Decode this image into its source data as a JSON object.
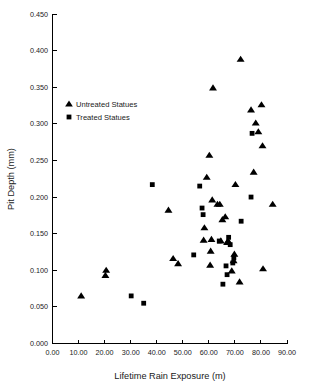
{
  "chart_data": {
    "type": "scatter",
    "title": "",
    "xlabel": "Lifetime Rain Exposure (m)",
    "ylabel": "Pit Depth (mm)",
    "xlim": [
      0,
      90
    ],
    "ylim": [
      0,
      0.45
    ],
    "xticks": [
      "0.00",
      "10.00",
      "20.00",
      "30.00",
      "40.00",
      "50.00",
      "60.00",
      "70.00",
      "80.00",
      "90.00"
    ],
    "xtick_values": [
      0,
      10,
      20,
      30,
      40,
      50,
      60,
      70,
      80,
      90
    ],
    "yticks": [
      "0.000",
      "0.050",
      "0.100",
      "0.150",
      "0.200",
      "0.250",
      "0.300",
      "0.350",
      "0.400",
      "0.450"
    ],
    "ytick_values": [
      0,
      0.05,
      0.1,
      0.15,
      0.2,
      0.25,
      0.3,
      0.35,
      0.4,
      0.45
    ],
    "grid": false,
    "legend_position": "upper-left-inside",
    "series": [
      {
        "name": "Untreated Statues",
        "marker": "triangle",
        "color": "#000000",
        "points": [
          [
            11.0,
            0.065
          ],
          [
            20.3,
            0.093
          ],
          [
            20.6,
            0.1
          ],
          [
            44.5,
            0.182
          ],
          [
            46.3,
            0.116
          ],
          [
            48.2,
            0.109
          ],
          [
            58.0,
            0.141
          ],
          [
            58.3,
            0.158
          ],
          [
            59.2,
            0.227
          ],
          [
            60.2,
            0.257
          ],
          [
            60.5,
            0.107
          ],
          [
            60.7,
            0.126
          ],
          [
            61.0,
            0.142
          ],
          [
            61.3,
            0.196
          ],
          [
            61.6,
            0.349
          ],
          [
            63.3,
            0.19
          ],
          [
            64.2,
            0.19
          ],
          [
            64.6,
            0.14
          ],
          [
            65.2,
            0.169
          ],
          [
            66.3,
            0.173
          ],
          [
            67.0,
            0.138
          ],
          [
            67.4,
            0.14
          ],
          [
            68.8,
            0.099
          ],
          [
            69.5,
            0.113
          ],
          [
            69.8,
            0.122
          ],
          [
            70.2,
            0.217
          ],
          [
            71.8,
            0.084
          ],
          [
            72.2,
            0.388
          ],
          [
            76.2,
            0.319
          ],
          [
            77.2,
            0.234
          ],
          [
            78.0,
            0.301
          ],
          [
            79.0,
            0.289
          ],
          [
            80.2,
            0.326
          ],
          [
            80.6,
            0.27
          ],
          [
            80.8,
            0.102
          ],
          [
            84.5,
            0.19
          ]
        ]
      },
      {
        "name": "Treated Statues",
        "marker": "square",
        "color": "#000000",
        "points": [
          [
            30.2,
            0.065
          ],
          [
            35.0,
            0.055
          ],
          [
            38.3,
            0.217
          ],
          [
            54.2,
            0.121
          ],
          [
            56.5,
            0.215
          ],
          [
            57.4,
            0.185
          ],
          [
            57.8,
            0.176
          ],
          [
            64.0,
            0.14
          ],
          [
            65.4,
            0.081
          ],
          [
            66.6,
            0.106
          ],
          [
            67.0,
            0.094
          ],
          [
            67.6,
            0.145
          ],
          [
            68.2,
            0.135
          ],
          [
            69.2,
            0.11
          ],
          [
            69.6,
            0.117
          ],
          [
            72.4,
            0.167
          ],
          [
            76.2,
            0.2
          ],
          [
            76.6,
            0.287
          ]
        ]
      }
    ]
  },
  "legend": {
    "items": [
      {
        "label": "Untreated Statues",
        "marker": "triangle"
      },
      {
        "label": "Treated Statues",
        "marker": "square"
      }
    ]
  },
  "colors": {
    "marker": "#000000",
    "axis": "#000000",
    "text": "#1a1a1a",
    "background": "#ffffff"
  }
}
